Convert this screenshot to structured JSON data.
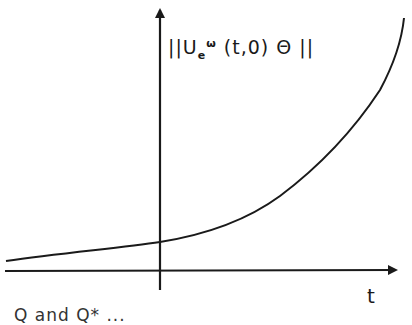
{
  "diagram": {
    "type": "function-plot",
    "y_axis_label": {
      "prefix": "||U",
      "subscript": "e",
      "superscript": "ω",
      "suffix": " (t,0) Θ ||"
    },
    "x_axis_label": "t",
    "curve": "exponentially increasing curve, crossing y-axis at a small positive value",
    "caption_fragment": "Q and Q* ..."
  },
  "colors": {
    "ink": "#1a1a1a",
    "background": "#ffffff"
  }
}
